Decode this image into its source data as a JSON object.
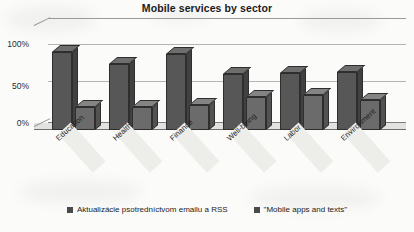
{
  "chart_data": {
    "type": "bar",
    "title": "Mobile services by sector",
    "xlabel": "",
    "ylabel": "",
    "ylim": [
      0,
      100
    ],
    "yticks": [
      "0%",
      "50%",
      "100%"
    ],
    "grid": true,
    "legend_position": "bottom",
    "style": "3d-clustered-column",
    "categories": [
      "Education",
      "Health",
      "Finance",
      "Well-being",
      "Labor",
      "Environment"
    ],
    "series": [
      {
        "name": "Aktualizácie psotredníctvom emailu a RSS",
        "color": "#575757",
        "values": [
          100,
          85,
          97,
          72,
          73,
          75
        ]
      },
      {
        "name": "\"Mobile apps and texts\"",
        "color": "#6b6b6b",
        "values": [
          30,
          30,
          32,
          42,
          45,
          38
        ]
      }
    ]
  },
  "legend": {
    "items": [
      {
        "label": "Aktualizácie psotredníctvom emailu a RSS"
      },
      {
        "label": "\"Mobile apps and texts\""
      }
    ]
  }
}
